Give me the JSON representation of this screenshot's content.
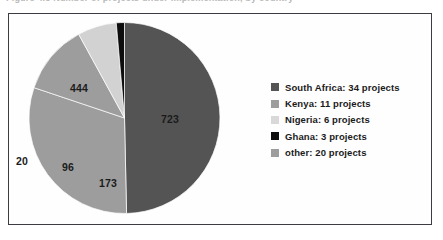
{
  "caption": {
    "text": "Figure 4.3   Number of projects under implementation, by country"
  },
  "chart_data": {
    "type": "pie",
    "title": "",
    "categories": [
      "South Africa",
      "Kenya",
      "other",
      "Nigeria",
      "Ghana"
    ],
    "values": [
      723,
      444,
      173,
      96,
      20
    ],
    "data_labels": [
      "723",
      "444",
      "173",
      "96",
      "20"
    ],
    "legend_position": "right",
    "grid": false,
    "colors": [
      "#545454",
      "#9d9d9d",
      "#9d9d9d",
      "#d2d2d2",
      "#0d0d0d"
    ],
    "start_angle_deg": 0,
    "direction": "clockwise"
  },
  "pie": {
    "labels": [
      {
        "name": "south-africa",
        "text": "723",
        "x": 161,
        "y": 113
      },
      {
        "name": "kenya",
        "text": "444",
        "x": 70,
        "y": 82
      },
      {
        "name": "other",
        "text": "173",
        "x": 99,
        "y": 177
      },
      {
        "name": "nigeria",
        "text": "96",
        "x": 62,
        "y": 161
      },
      {
        "name": "ghana",
        "text": "20",
        "x": 16,
        "y": 155
      }
    ]
  },
  "legend": {
    "items": [
      {
        "label": "South Africa: 34 projects",
        "color": "#545454",
        "name": "south-africa"
      },
      {
        "label": "Kenya: 11 projects",
        "color": "#9d9d9d",
        "name": "kenya"
      },
      {
        "label": "Nigeria: 6 projects",
        "color": "#d8d8d8",
        "name": "nigeria"
      },
      {
        "label": "Ghana: 3 projects",
        "color": "#0d0d0d",
        "name": "ghana"
      },
      {
        "label": "other: 20 projects",
        "color": "#9d9d9d",
        "name": "other"
      }
    ]
  },
  "colors": {
    "frame_border": "#3c3c42",
    "background": "#ffffff",
    "label_text": "#1b1b1b"
  }
}
